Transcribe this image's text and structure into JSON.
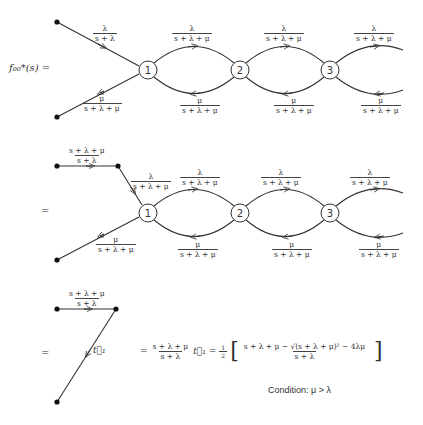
{
  "figure": {
    "lhs_label": "f₀₀*(s) =",
    "equals": "=",
    "nodes": [
      "1",
      "2",
      "3"
    ],
    "colors": {
      "stroke": "#333333",
      "background": "#ffffff"
    }
  },
  "diagram1": {
    "in_edge": {
      "num": "λ",
      "den": "s + λ"
    },
    "out_edge": {
      "num": "μ",
      "den": "s + λ + μ"
    },
    "forward_edges": [
      {
        "num": "λ",
        "den": "s + λ + μ"
      },
      {
        "num": "λ",
        "den": "s + λ + μ"
      },
      {
        "num": "λ",
        "den": "s + λ + μ"
      }
    ],
    "backward_edges": [
      {
        "num": "μ",
        "den": "s + λ + μ"
      },
      {
        "num": "μ",
        "den": "s + λ + μ"
      },
      {
        "num": "μ",
        "den": "s + λ + μ"
      }
    ]
  },
  "diagram2": {
    "top_edge": {
      "num": "s + λ + μ",
      "den": "s + λ"
    },
    "in_edge": {
      "num": "λ",
      "den": "s + λ + μ"
    },
    "out_edge": {
      "num": "μ",
      "den": "s + λ + μ"
    },
    "forward_edges": [
      {
        "num": "λ",
        "den": "s + λ + μ"
      },
      {
        "num": "λ",
        "den": "s + λ + μ"
      },
      {
        "num": "λ",
        "den": "s + λ + μ"
      }
    ],
    "backward_edges": [
      {
        "num": "μ",
        "den": "s + λ + μ"
      },
      {
        "num": "μ",
        "den": "s + λ + μ"
      },
      {
        "num": "μ",
        "den": "s + λ + μ"
      }
    ]
  },
  "diagram3": {
    "top_edge": {
      "num": "s + λ + μ",
      "den": "s + λ"
    },
    "diag_label": "t⃗₁",
    "result": {
      "eq1": "=",
      "coef_num": "s + λ + μ",
      "coef_den": "s + λ",
      "t_vec": "t⃗₁",
      "eq2": "=",
      "half_num": "1",
      "half_den": "2",
      "bracket_num": "s + λ + μ − √(s + λ + μ)² − 4λμ",
      "bracket_den": "s + λ"
    },
    "condition": "Condition: μ > λ"
  }
}
